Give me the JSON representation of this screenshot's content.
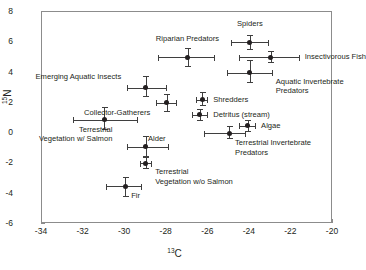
{
  "chart_data": {
    "type": "scatter",
    "title": "",
    "xlabel": "13C",
    "ylabel": "15N",
    "xlabel_parts": {
      "sup": "13",
      "base": "C"
    },
    "ylabel_parts": {
      "sup": "15",
      "base": "N"
    },
    "xlim": [
      -34,
      -20
    ],
    "ylim": [
      -6,
      8
    ],
    "xticks": [
      "-34",
      "-32",
      "-30",
      "-28",
      "-26",
      "-24",
      "-22",
      "-20"
    ],
    "xtick_values": [
      -34,
      -32,
      -30,
      -28,
      -26,
      -24,
      -22,
      -20
    ],
    "yticks": [
      "8",
      "6",
      "4",
      "2",
      "0",
      "-2",
      "-4",
      "-6"
    ],
    "ytick_values": [
      8,
      6,
      4,
      2,
      0,
      -2,
      -4,
      -6
    ],
    "grid": false,
    "legend": "none",
    "error_bars": "both-axes",
    "marker": "filled-circle",
    "marker_color": "#231f20",
    "points": [
      {
        "name": "Spiders",
        "x": -24.0,
        "y": 6.0,
        "xerr_low": -24.9,
        "xerr_high": -23.1,
        "yerr_low": 5.5,
        "yerr_high": 6.5,
        "label": "Spiders",
        "label_pos": "above"
      },
      {
        "name": "Insectivorous Fish",
        "x": -23.0,
        "y": 5.0,
        "xerr_low": -24.5,
        "xerr_high": -21.6,
        "yerr_low": 4.6,
        "yerr_high": 5.4,
        "label": "Insectivorous Fish",
        "label_pos": "right"
      },
      {
        "name": "Riparian Predators",
        "x": -27.0,
        "y": 5.0,
        "xerr_low": -28.4,
        "xerr_high": -25.7,
        "yerr_low": 4.4,
        "yerr_high": 5.6,
        "label": "Riparian Predators",
        "label_pos": "above"
      },
      {
        "name": "Aquatic Invertebrate Predators",
        "x": -24.0,
        "y": 4.0,
        "xerr_low": -25.1,
        "xerr_high": -22.9,
        "yerr_low": 3.3,
        "yerr_high": 4.8,
        "label": "Aquatic Invertebrate\nPredators",
        "label_pos": "right-below"
      },
      {
        "name": "Emerging Aquatic Insects",
        "x": -29.0,
        "y": 3.0,
        "xerr_low": -29.9,
        "xerr_high": -28.0,
        "yerr_low": 2.4,
        "yerr_high": 3.8,
        "label": "Emerging Aquatic Insects",
        "label_pos": "left-above"
      },
      {
        "name": "Shredders",
        "x": -26.3,
        "y": 2.2,
        "xerr_low": -26.6,
        "xerr_high": -26.0,
        "yerr_low": 1.8,
        "yerr_high": 2.7,
        "label": "Shredders",
        "label_pos": "right"
      },
      {
        "name": "Collector-Gatherers",
        "x": -28.0,
        "y": 2.0,
        "xerr_low": -28.5,
        "xerr_high": -27.5,
        "yerr_low": 1.4,
        "yerr_high": 2.6,
        "label": "Collector-Gatherers",
        "label_pos": "left-below"
      },
      {
        "name": "Detritus (stream)",
        "x": -26.4,
        "y": 1.2,
        "xerr_low": -26.8,
        "xerr_high": -26.0,
        "yerr_low": 0.8,
        "yerr_high": 1.6,
        "label": "Detritus (stream)",
        "label_pos": "right"
      },
      {
        "name": "Terrestrial Vegetation w/ Salmon",
        "x": -31.0,
        "y": 0.9,
        "xerr_low": -32.5,
        "xerr_high": -29.4,
        "yerr_low": 0.2,
        "yerr_high": 1.7,
        "label": "Terrestrial\nVegetation w/ Salmon",
        "label_pos": "below-left"
      },
      {
        "name": "Algae",
        "x": -24.1,
        "y": 0.5,
        "xerr_low": -24.5,
        "xerr_high": -23.7,
        "yerr_low": 0.1,
        "yerr_high": 0.9,
        "label": "Algae",
        "label_pos": "right"
      },
      {
        "name": "Terrestrial Invertebrate Predators",
        "x": -25.0,
        "y": 0.0,
        "xerr_low": -26.2,
        "xerr_high": -24.2,
        "yerr_low": -0.4,
        "yerr_high": 0.5,
        "label": "Terrestrial Invertebrate\nPredators",
        "label_pos": "below-right"
      },
      {
        "name": "Alder",
        "x": -29.0,
        "y": -0.9,
        "xerr_low": -29.9,
        "xerr_high": -27.9,
        "yerr_low": -1.6,
        "yerr_high": -0.2,
        "label": "Alder",
        "label_pos": "above-right"
      },
      {
        "name": "Terrestrial Vegetation w/o Salmon",
        "x": -29.0,
        "y": -2.0,
        "xerr_low": -29.3,
        "xerr_high": -28.7,
        "yerr_low": -2.4,
        "yerr_high": -1.6,
        "label": "Terrestrial\nVegetation w/o Salmon",
        "label_pos": "right-below"
      },
      {
        "name": "Fir",
        "x": -30.0,
        "y": -3.5,
        "xerr_low": -30.9,
        "xerr_high": -29.2,
        "yerr_low": -4.2,
        "yerr_high": -2.9,
        "label": "Fir",
        "label_pos": "below-right"
      }
    ]
  }
}
